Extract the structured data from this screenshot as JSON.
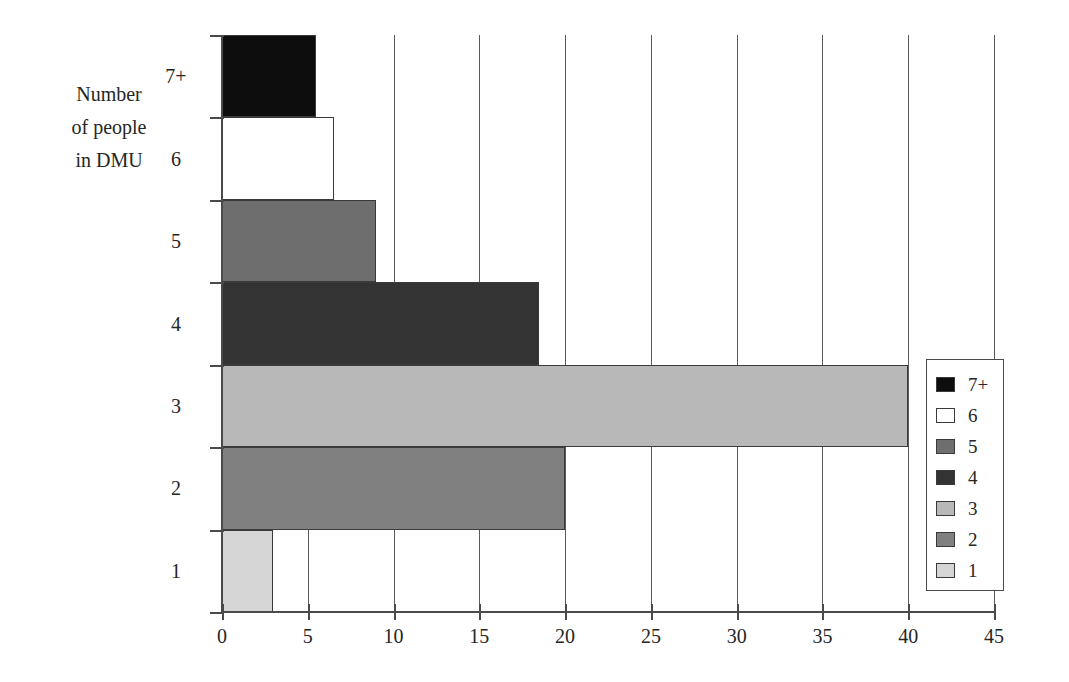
{
  "chart_data": {
    "type": "bar",
    "orientation": "horizontal",
    "title": "",
    "xlabel": "",
    "ylabel": "Number of people in DMU",
    "ylabel_lines": [
      "Number",
      "of people",
      "in DMU"
    ],
    "categories": [
      "1",
      "2",
      "3",
      "4",
      "5",
      "6",
      "7+"
    ],
    "values": [
      3,
      20,
      40,
      18.5,
      9,
      6.5,
      5.5
    ],
    "series": [
      {
        "name": "Number of people in DMU",
        "values": [
          3,
          20,
          40,
          18.5,
          9,
          6.5,
          5.5
        ]
      }
    ],
    "xlim": [
      0,
      45
    ],
    "xticks": [
      0,
      5,
      10,
      15,
      20,
      25,
      30,
      35,
      40,
      45
    ],
    "xtick_labels": [
      "0",
      "5",
      "10",
      "15",
      "20",
      "25",
      "30",
      "35",
      "40",
      "45"
    ],
    "ytick_labels_top_to_bottom": [
      "7+",
      "6",
      "5",
      "4",
      "3",
      "2",
      "1"
    ],
    "grid": "vertical",
    "legend_position": "right",
    "legend_entries": [
      {
        "label": "7+",
        "color": "#0d0d0d"
      },
      {
        "label": "6",
        "color": "#ffffff"
      },
      {
        "label": "5",
        "color": "#6e6e6e"
      },
      {
        "label": "4",
        "color": "#333333"
      },
      {
        "label": "3",
        "color": "#b8b8b8"
      },
      {
        "label": "2",
        "color": "#808080"
      },
      {
        "label": "1",
        "color": "#d5d5d5"
      }
    ],
    "bars_top_to_bottom": [
      {
        "category": "7+",
        "value": 5.5,
        "color": "#0d0d0d"
      },
      {
        "category": "6",
        "value": 6.5,
        "color": "#ffffff"
      },
      {
        "category": "5",
        "value": 9,
        "color": "#6e6e6e"
      },
      {
        "category": "4",
        "value": 18.5,
        "color": "#333333"
      },
      {
        "category": "3",
        "value": 40,
        "color": "#b8b8b8"
      },
      {
        "category": "2",
        "value": 20,
        "color": "#808080"
      },
      {
        "category": "1",
        "value": 3,
        "color": "#d5d5d5"
      }
    ],
    "colors": {
      "axis": "#4a4a4a",
      "gridline": "#5a5a5a",
      "bar_outline": "#3a3a3a",
      "text": "#262626",
      "background": "#ffffff"
    }
  }
}
